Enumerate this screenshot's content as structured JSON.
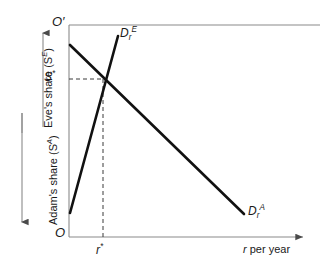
{
  "figure": {
    "type": "economics-diagram"
  },
  "axes": {
    "origin_bottom_label": "O",
    "origin_top_label": "O′",
    "x_axis_label": "r per year",
    "x_axis_label_italic_part": "r",
    "y_left_upper_label": "Eve's share (S",
    "y_left_upper_label_sup": "E",
    "y_left_upper_label_close": ")",
    "y_left_lower_label": "Adam's share (S",
    "y_left_lower_label_sup": "A",
    "y_left_lower_label_close": ")",
    "eve_arrow_direction": "up",
    "adam_arrow_direction": "down"
  },
  "curves": [
    {
      "id": "eve-demand",
      "label_base": "D",
      "label_sub": "r",
      "label_sup": "E",
      "slope": "upward",
      "start": {
        "x": 70,
        "y": 213
      },
      "end": {
        "x": 118,
        "y": 36
      }
    },
    {
      "id": "adam-demand",
      "label_base": "D",
      "label_sub": "r",
      "label_sup": "A",
      "slope": "downward",
      "start": {
        "x": 70,
        "y": 45
      },
      "end": {
        "x": 244,
        "y": 214
      }
    }
  ],
  "equilibrium": {
    "y_label_base": "S",
    "y_label_star": "*",
    "x_label_base": "r",
    "x_label_star": "*",
    "point": {
      "x": 103,
      "y": 79
    },
    "guide_style": "dashed"
  },
  "colors": {
    "curve": "#1a1a1a",
    "axis": "#7a7a7a",
    "guide": "#555555",
    "background": "#ffffff",
    "text": "#1a1a1a"
  }
}
